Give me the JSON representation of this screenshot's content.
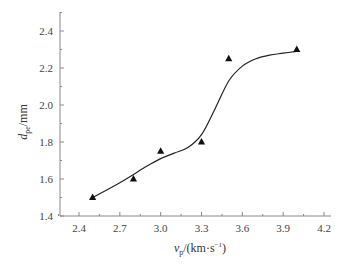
{
  "chart_data": {
    "type": "scatter",
    "title": "",
    "xlabel": "v_p/(km·s⁻¹)",
    "xlabel_main": "v",
    "xlabel_sub": "p",
    "xlabel_unit": "/(km·s",
    "xlabel_sup": "−1",
    "xlabel_close": ")",
    "ylabel": "d_pe/mm",
    "ylabel_main": "d",
    "ylabel_sub": "pe",
    "ylabel_unit": "/mm",
    "xlim": [
      2.25,
      4.2
    ],
    "ylim": [
      1.4,
      2.5
    ],
    "x_ticks": [
      2.4,
      2.7,
      3.0,
      3.3,
      3.6,
      3.9,
      4.2
    ],
    "x_tick_labels": [
      "2.4",
      "2.7",
      "3.0",
      "3.3",
      "3.6",
      "3.9",
      "4.2"
    ],
    "y_ticks": [
      1.4,
      1.6,
      1.8,
      2.0,
      2.2,
      2.4
    ],
    "y_tick_labels": [
      "1.4",
      "1.6",
      "1.8",
      "2.0",
      "2.2",
      "2.4"
    ],
    "grid": false,
    "legend": null,
    "series": [
      {
        "name": "measured",
        "marker": "triangle",
        "x": [
          2.5,
          2.8,
          3.0,
          3.3,
          3.5,
          4.0
        ],
        "y": [
          1.5,
          1.6,
          1.75,
          1.8,
          2.25,
          2.3
        ]
      },
      {
        "name": "fitted curve",
        "type": "line",
        "x": [
          2.5,
          2.7,
          2.9,
          3.0,
          3.1,
          3.2,
          3.3,
          3.4,
          3.5,
          3.6,
          3.7,
          3.8,
          3.9,
          4.0
        ],
        "y": [
          1.5,
          1.58,
          1.67,
          1.71,
          1.74,
          1.77,
          1.84,
          1.98,
          2.13,
          2.21,
          2.25,
          2.27,
          2.28,
          2.29
        ]
      }
    ],
    "colors": {
      "marker": "#111111",
      "line": "#222222",
      "axis": "#888888"
    }
  }
}
